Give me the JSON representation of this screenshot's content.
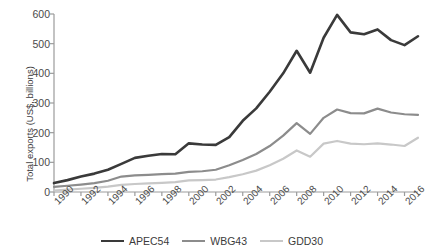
{
  "chart_data": {
    "type": "line",
    "title": "",
    "xlabel": "",
    "ylabel": "Total exports (US$, billions)",
    "ylim": [
      0,
      600
    ],
    "yticks": [
      0,
      100,
      200,
      300,
      400,
      500,
      600
    ],
    "ytick_labels": [
      "0",
      "100",
      "200",
      "300",
      "400",
      "500",
      "600"
    ],
    "xlim": [
      1990,
      2017
    ],
    "xticks": [
      1990,
      1992,
      1994,
      1996,
      1998,
      2000,
      2002,
      2004,
      2006,
      2008,
      2010,
      2012,
      2014,
      2016
    ],
    "xtick_labels": [
      "1990",
      "1992",
      "1994",
      "1996",
      "1998",
      "2000",
      "2002",
      "2004",
      "2006",
      "2008",
      "2010",
      "2012",
      "2014",
      "2016"
    ],
    "x": [
      1990,
      1991,
      1992,
      1993,
      1994,
      1995,
      1996,
      1997,
      1998,
      1999,
      2000,
      2001,
      2002,
      2003,
      2004,
      2005,
      2006,
      2007,
      2008,
      2009,
      2010,
      2011,
      2012,
      2013,
      2014,
      2015,
      2016,
      2017
    ],
    "grid": false,
    "legend_position": "bottom",
    "series": [
      {
        "name": "APEC54",
        "color": "#3a3a3a",
        "width": 2.6,
        "values": [
          30,
          40,
          52,
          62,
          75,
          95,
          115,
          122,
          128,
          127,
          164,
          160,
          159,
          185,
          240,
          282,
          338,
          400,
          476,
          402,
          520,
          597,
          538,
          532,
          548,
          512,
          495,
          525
        ]
      },
      {
        "name": "WBG43",
        "color": "#8c8c8c",
        "width": 2.2,
        "values": [
          17,
          21,
          25,
          30,
          38,
          52,
          56,
          58,
          60,
          62,
          68,
          70,
          75,
          90,
          108,
          128,
          155,
          190,
          232,
          196,
          250,
          278,
          266,
          265,
          281,
          268,
          262,
          260
        ]
      },
      {
        "name": "GDD30",
        "color": "#c8c8c8",
        "width": 2.2,
        "values": [
          5,
          8,
          11,
          14,
          18,
          24,
          27,
          29,
          31,
          33,
          39,
          40,
          42,
          50,
          60,
          72,
          90,
          112,
          140,
          119,
          163,
          172,
          163,
          161,
          164,
          160,
          155,
          183
        ]
      }
    ]
  },
  "legend": {
    "items": [
      {
        "label": "APEC54"
      },
      {
        "label": "WBG43"
      },
      {
        "label": "GDD30"
      }
    ]
  }
}
